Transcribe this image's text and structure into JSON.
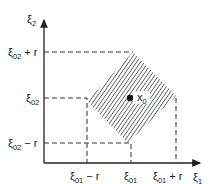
{
  "diagram": {
    "axes": {
      "x_label": "ξ",
      "x_label_sub": "1",
      "y_label": "ξ",
      "y_label_sub": "2"
    },
    "x_ticks": [
      {
        "base": "ξ",
        "sub": "01",
        "suffix": " − r"
      },
      {
        "base": "ξ",
        "sub": "01",
        "suffix": ""
      },
      {
        "base": "ξ",
        "sub": "01",
        "suffix": " + r"
      }
    ],
    "y_ticks": [
      {
        "base": "ξ",
        "sub": "02",
        "suffix": " + r"
      },
      {
        "base": "ξ",
        "sub": "02",
        "suffix": ""
      },
      {
        "base": "ξ",
        "sub": "02",
        "suffix": " − r"
      }
    ],
    "center_point": {
      "label": "x",
      "label_sub": "0"
    },
    "region": "hatched rotated square centered at x0 with half-extent r"
  }
}
